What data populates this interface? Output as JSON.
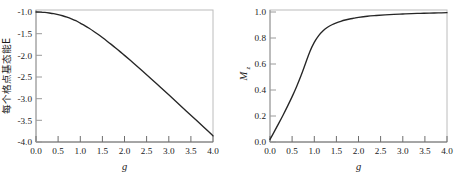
{
  "figure": {
    "background_color": "#ffffff",
    "frame_color": "#b8b8b8",
    "axis_color": "#808080",
    "curve_color": "#262626",
    "text_color": "#1a1a1a"
  },
  "chart_data": [
    {
      "type": "line",
      "panel": "left",
      "title": "",
      "xlabel": "g",
      "ylabel": "每个格点基态能E",
      "xlim": [
        0.0,
        4.0
      ],
      "ylim": [
        -4.2,
        -0.95
      ],
      "grid": false,
      "legend": "none",
      "xticks": [
        "0.0",
        "0.5",
        "1.0",
        "1.5",
        "2.0",
        "2.5",
        "3.0",
        "3.5",
        "4.0"
      ],
      "xtick_values": [
        0.0,
        0.5,
        1.0,
        1.5,
        2.0,
        2.5,
        3.0,
        3.5,
        4.0
      ],
      "yticks": [
        "-1.0",
        "-1.5",
        "-2.0",
        "-2.5",
        "-3.0",
        "-3.5",
        "-4.0"
      ],
      "ytick_values": [
        -1.0,
        -1.5,
        -2.0,
        -2.5,
        -3.0,
        -3.5,
        -4.0
      ],
      "series": [
        {
          "name": "每个格点基态能E",
          "x": [
            0.0,
            0.1,
            0.2,
            0.3,
            0.4,
            0.5,
            0.6,
            0.7,
            0.8,
            0.9,
            1.0,
            1.1,
            1.2,
            1.3,
            1.4,
            1.5,
            1.6,
            1.7,
            1.8,
            1.9,
            2.0,
            2.2,
            2.4,
            2.6,
            2.8,
            3.0,
            3.2,
            3.4,
            3.6,
            3.8,
            4.0
          ],
          "values": [
            -1.0,
            -1.003,
            -1.01,
            -1.023,
            -1.04,
            -1.063,
            -1.092,
            -1.126,
            -1.166,
            -1.212,
            -1.273,
            -1.333,
            -1.4,
            -1.472,
            -1.548,
            -1.628,
            -1.711,
            -1.797,
            -1.885,
            -1.975,
            -2.067,
            -2.255,
            -2.447,
            -2.642,
            -2.84,
            -3.039,
            -3.239,
            -3.44,
            -3.642,
            -3.844,
            -4.047
          ]
        }
      ]
    },
    {
      "type": "line",
      "panel": "right",
      "title": "",
      "xlabel": "g",
      "ylabel": "M",
      "ylabel_subscript": "z",
      "xlim": [
        0.0,
        4.0
      ],
      "ylim": [
        -0.02,
        1.01
      ],
      "grid": false,
      "legend": "none",
      "xticks": [
        "0.0",
        "0.5",
        "1.0",
        "1.5",
        "2.0",
        "2.5",
        "3.0",
        "3.5",
        "4.0"
      ],
      "xtick_values": [
        0.0,
        0.5,
        1.0,
        1.5,
        2.0,
        2.5,
        3.0,
        3.5,
        4.0
      ],
      "yticks": [
        "0.0",
        "0.2",
        "0.4",
        "0.6",
        "0.8",
        "1.0"
      ],
      "ytick_values": [
        0.0,
        0.2,
        0.4,
        0.6,
        0.8,
        1.0
      ],
      "series": [
        {
          "name": "Mz",
          "x": [
            0.0,
            0.1,
            0.2,
            0.3,
            0.4,
            0.5,
            0.6,
            0.7,
            0.8,
            0.9,
            1.0,
            1.1,
            1.2,
            1.3,
            1.4,
            1.5,
            1.6,
            1.7,
            1.8,
            1.9,
            2.0,
            2.2,
            2.4,
            2.6,
            2.8,
            3.0,
            3.2,
            3.4,
            3.6,
            3.8,
            4.0
          ],
          "values": [
            0.0,
            0.063,
            0.127,
            0.193,
            0.262,
            0.334,
            0.412,
            0.497,
            0.591,
            0.685,
            0.757,
            0.81,
            0.848,
            0.875,
            0.895,
            0.91,
            0.922,
            0.932,
            0.94,
            0.946,
            0.952,
            0.961,
            0.967,
            0.972,
            0.976,
            0.979,
            0.982,
            0.984,
            0.986,
            0.987,
            0.989
          ]
        }
      ]
    }
  ],
  "panels": {
    "left": {
      "name": "ground-state-energy-plot",
      "xlabel": "g",
      "ylabel": "每个格点基态能E",
      "xticks": [
        "0.0",
        "0.5",
        "1.0",
        "1.5",
        "2.0",
        "2.5",
        "3.0",
        "3.5",
        "4.0"
      ],
      "yticks": [
        "-1.0",
        "-1.5",
        "-2.0",
        "-2.5",
        "-3.0",
        "-3.5",
        "-4.0"
      ]
    },
    "right": {
      "name": "magnetization-plot",
      "xlabel": "g",
      "ylabel": "M",
      "ylabel_sub": "z",
      "xticks": [
        "0.0",
        "0.5",
        "1.0",
        "1.5",
        "2.0",
        "2.5",
        "3.0",
        "3.5",
        "4.0"
      ],
      "yticks": [
        "0.0",
        "0.2",
        "0.4",
        "0.6",
        "0.8",
        "1.0"
      ]
    }
  }
}
